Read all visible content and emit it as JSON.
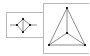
{
  "diagram": {
    "colors": {
      "box": "#b8b8b8",
      "edge": "#6e6e6e",
      "node": "#222222",
      "background": "#ffffff"
    },
    "panels": [
      {
        "id": "left-graph",
        "box": {
          "x": 6,
          "y": 12,
          "w": 37,
          "h": 25
        },
        "nodes": [
          {
            "id": "top",
            "x": 23,
            "y": 19
          },
          {
            "id": "left",
            "x": 17,
            "y": 25
          },
          {
            "id": "right",
            "x": 30,
            "y": 25
          },
          {
            "id": "bottom",
            "x": 23,
            "y": 32
          }
        ],
        "edges": [
          {
            "from": [
              10,
              25
            ],
            "to": [
              17,
              25
            ]
          },
          {
            "from": [
              30,
              25
            ],
            "to": [
              37,
              25
            ]
          },
          {
            "from": [
              23,
              19
            ],
            "to": [
              17,
              25
            ]
          },
          {
            "from": [
              23,
              19
            ],
            "to": [
              30,
              25
            ]
          },
          {
            "from": [
              17,
              25
            ],
            "to": [
              23,
              32
            ]
          },
          {
            "from": [
              30,
              25
            ],
            "to": [
              23,
              32
            ]
          },
          {
            "from": [
              23,
              19
            ],
            "to": [
              23,
              32
            ]
          }
        ]
      },
      {
        "id": "right-graph",
        "box": {
          "x": 43,
          "y": 3,
          "w": 46,
          "h": 50
        },
        "nodes": [
          {
            "id": "apex",
            "x": 67,
            "y": 8
          },
          {
            "id": "center",
            "x": 67,
            "y": 33
          },
          {
            "id": "bottom-left",
            "x": 49,
            "y": 45
          },
          {
            "id": "bottom-right",
            "x": 85,
            "y": 45
          }
        ],
        "edges": [
          {
            "from": [
              67,
              8
            ],
            "to": [
              49,
              45
            ]
          },
          {
            "from": [
              67,
              8
            ],
            "to": [
              85,
              45
            ]
          },
          {
            "from": [
              49,
              45
            ],
            "to": [
              85,
              45
            ]
          },
          {
            "from": [
              67,
              8
            ],
            "to": [
              67,
              33
            ]
          },
          {
            "from": [
              67,
              33
            ],
            "to": [
              49,
              45
            ]
          },
          {
            "from": [
              67,
              33
            ],
            "to": [
              85,
              45
            ]
          }
        ]
      }
    ]
  }
}
